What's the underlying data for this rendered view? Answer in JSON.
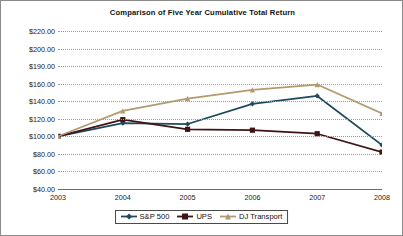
{
  "chart_data": {
    "type": "line",
    "title": "Comparison of Five Year Cumulative Total Return",
    "xlabel": "",
    "ylabel": "",
    "categories": [
      "2003",
      "2004",
      "2005",
      "2006",
      "2007",
      "2008"
    ],
    "x": [
      2003,
      2004,
      2005,
      2006,
      2007,
      2008
    ],
    "ytick_labels": [
      "$220.00",
      "$200.00",
      "$190.00",
      "$160.00",
      "$140.00",
      "$120.00",
      "$100.00",
      "$80.00",
      "$60.00",
      "$40.00"
    ],
    "ytick_values": [
      220,
      200,
      190,
      160,
      140,
      120,
      100,
      80,
      60,
      40
    ],
    "ylim": [
      40,
      220
    ],
    "grid": true,
    "legend_position": "bottom",
    "series": [
      {
        "name": "S&P 500",
        "color": "#1d4a5e",
        "marker": "diamond",
        "values": [
          100.0,
          115.0,
          114.0,
          137.0,
          146.0,
          90.0
        ]
      },
      {
        "name": "UPS",
        "color": "#3f1414",
        "marker": "square",
        "values": [
          100.0,
          119.0,
          108.0,
          107.0,
          103.0,
          82.0
        ]
      },
      {
        "name": "DJ Transport",
        "color": "#b09a6e",
        "marker": "triangle",
        "values": [
          100.0,
          129.0,
          143.0,
          153.0,
          159.0,
          126.0
        ]
      }
    ]
  },
  "legend": {
    "items": [
      {
        "label": "S&P 500"
      },
      {
        "label": "UPS"
      },
      {
        "label": "DJ Transport"
      }
    ]
  }
}
